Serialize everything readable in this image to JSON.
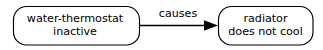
{
  "diagram": {
    "type": "causal-graph",
    "background_color": "#ffffff",
    "stroke_color": "#000000",
    "nodes": [
      {
        "id": "cause",
        "shape": "rounded-rectangle",
        "lines": [
          "water-thermostat",
          "inactive"
        ],
        "text": "water-thermostat inactive"
      },
      {
        "id": "effect",
        "shape": "rounded-rectangle",
        "lines": [
          "radiator",
          "does not cool"
        ],
        "text": "radiator does not cool"
      }
    ],
    "edges": [
      {
        "id": "cause-to-effect",
        "from": "cause",
        "to": "effect",
        "label": "causes",
        "arrowhead": "solid-triangle",
        "direction": "left-to-right"
      }
    ]
  }
}
